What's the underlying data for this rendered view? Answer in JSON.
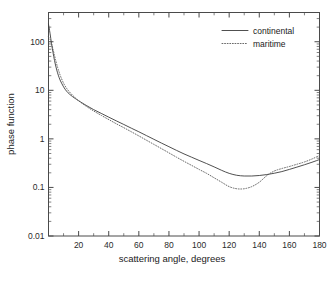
{
  "chart_data": {
    "type": "line",
    "title": "",
    "xlabel": "scattering angle, degrees",
    "ylabel": "phase function",
    "xlim": [
      0,
      180
    ],
    "ylim": [
      0.01,
      400
    ],
    "yscale": "log",
    "xscale": "linear",
    "grid": false,
    "legend_position": "top-right",
    "xticks": [
      0,
      20,
      40,
      60,
      80,
      100,
      120,
      140,
      160,
      180
    ],
    "xticklabels": [
      "",
      "20",
      "40",
      "60",
      "80",
      "100",
      "120",
      "140",
      "160",
      "180"
    ],
    "yticks": [
      0.01,
      0.1,
      1,
      10,
      100
    ],
    "yticklabels": [
      "0.01",
      "0.1",
      "1",
      "10",
      "100"
    ],
    "series": [
      {
        "name": "continental",
        "style": "solid",
        "color": "#3c3c3c",
        "x": [
          0,
          1,
          2,
          3,
          4,
          5,
          6,
          7,
          8,
          10,
          12,
          14,
          16,
          18,
          20,
          25,
          30,
          35,
          40,
          45,
          50,
          55,
          60,
          65,
          70,
          75,
          80,
          85,
          90,
          95,
          100,
          105,
          110,
          115,
          120,
          125,
          130,
          135,
          140,
          145,
          150,
          155,
          160,
          165,
          170,
          175,
          180
        ],
        "y": [
          230,
          150,
          92,
          60,
          41,
          30,
          23,
          18.5,
          15.5,
          11.8,
          9.6,
          8.3,
          7.4,
          6.7,
          6.1,
          4.9,
          4.0,
          3.35,
          2.8,
          2.35,
          1.98,
          1.66,
          1.4,
          1.17,
          0.98,
          0.82,
          0.69,
          0.58,
          0.49,
          0.42,
          0.36,
          0.31,
          0.265,
          0.225,
          0.195,
          0.178,
          0.172,
          0.172,
          0.176,
          0.184,
          0.196,
          0.212,
          0.235,
          0.262,
          0.293,
          0.33,
          0.375
        ]
      },
      {
        "name": "maritime",
        "style": "dotted",
        "color": "#5a5a5a",
        "x": [
          0,
          1,
          2,
          3,
          4,
          5,
          6,
          7,
          8,
          10,
          12,
          14,
          16,
          18,
          20,
          25,
          30,
          35,
          40,
          45,
          50,
          55,
          60,
          65,
          70,
          75,
          80,
          85,
          90,
          95,
          100,
          105,
          110,
          115,
          120,
          125,
          130,
          135,
          140,
          145,
          150,
          155,
          160,
          165,
          170,
          175,
          180
        ],
        "y": [
          125,
          112,
          92,
          70,
          52,
          39,
          30,
          24,
          19.5,
          14.0,
          11.0,
          9.2,
          7.9,
          6.9,
          6.1,
          4.7,
          3.75,
          3.05,
          2.5,
          2.05,
          1.7,
          1.4,
          1.15,
          0.94,
          0.77,
          0.63,
          0.515,
          0.42,
          0.345,
          0.285,
          0.235,
          0.195,
          0.158,
          0.128,
          0.104,
          0.094,
          0.094,
          0.104,
          0.128,
          0.175,
          0.218,
          0.245,
          0.27,
          0.3,
          0.335,
          0.385,
          0.455
        ]
      }
    ]
  },
  "axes": {
    "ylabel": "phase function",
    "xlabel": "scattering angle, degrees"
  },
  "legend": {
    "entries": [
      {
        "label": "continental",
        "style": "solid"
      },
      {
        "label": "maritime",
        "style": "dotted"
      }
    ]
  },
  "ticklabels": {
    "y": [
      "100",
      "10",
      "1",
      "0.1",
      "0.01"
    ],
    "x": [
      "20",
      "40",
      "60",
      "80",
      "100",
      "120",
      "140",
      "160",
      "180"
    ]
  }
}
